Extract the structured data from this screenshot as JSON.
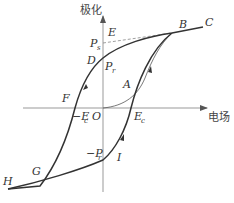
{
  "diagram": {
    "axes": {
      "y_label": "极化",
      "x_label": "电场",
      "origin_label": "O"
    },
    "points": {
      "A": "A",
      "B": "B",
      "C": "C",
      "D": "D",
      "E": "E",
      "F": "F",
      "G": "G",
      "H": "H",
      "I": "I"
    },
    "quantities": {
      "Ps": {
        "main": "P",
        "sub": "s"
      },
      "Pr": {
        "main": "P",
        "sub": "r"
      },
      "neg_Pr": {
        "main": "−P",
        "sub": "r"
      },
      "Ec": {
        "main": "E",
        "sub": "c"
      },
      "neg_Ec": {
        "main": "−E",
        "sub": "c"
      }
    },
    "colors": {
      "curve": "#333333",
      "axis": "#888888",
      "dashed": "#777777",
      "text": "#333333"
    }
  }
}
